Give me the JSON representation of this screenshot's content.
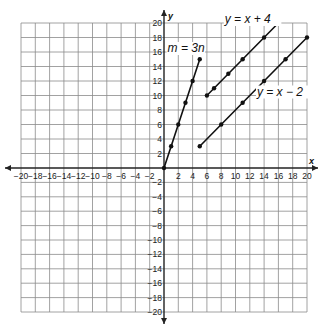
{
  "problem_number": "",
  "chart_data": {
    "type": "line",
    "title": "",
    "xlabel": "x",
    "ylabel": "y",
    "xlim": [
      -20,
      20
    ],
    "ylim": [
      -20,
      20
    ],
    "grid": true,
    "grid_step": 2,
    "x_ticks": [
      -20,
      -18,
      -16,
      -14,
      -12,
      -10,
      -8,
      -6,
      -4,
      -2,
      2,
      4,
      6,
      8,
      10,
      12,
      14,
      16,
      18,
      20
    ],
    "y_ticks": [
      20,
      18,
      16,
      14,
      12,
      10,
      8,
      6,
      4,
      2,
      -2,
      -4,
      -6,
      -8,
      -10,
      -12,
      -14,
      -16,
      -18,
      -20
    ],
    "series": [
      {
        "name": "m = 3n",
        "x": [
          0,
          1,
          2,
          3,
          4,
          5
        ],
        "y": [
          0,
          3,
          6,
          9,
          12,
          15
        ]
      },
      {
        "name": "y = x + 4",
        "x": [
          6,
          7,
          9,
          11,
          14,
          16
        ],
        "y": [
          10,
          11,
          13,
          15,
          18,
          20
        ]
      },
      {
        "name": "y = x - 2",
        "x": [
          5,
          8,
          11,
          14,
          17,
          20
        ],
        "y": [
          3,
          6,
          9,
          12,
          15,
          18
        ]
      }
    ],
    "annotations": [
      {
        "text": "m = 3n",
        "x": 0.5,
        "y": 16
      },
      {
        "text": "y = x + 4",
        "x": 8.5,
        "y": 20
      },
      {
        "text": "y = x − 2",
        "x": 13,
        "y": 10
      }
    ]
  }
}
